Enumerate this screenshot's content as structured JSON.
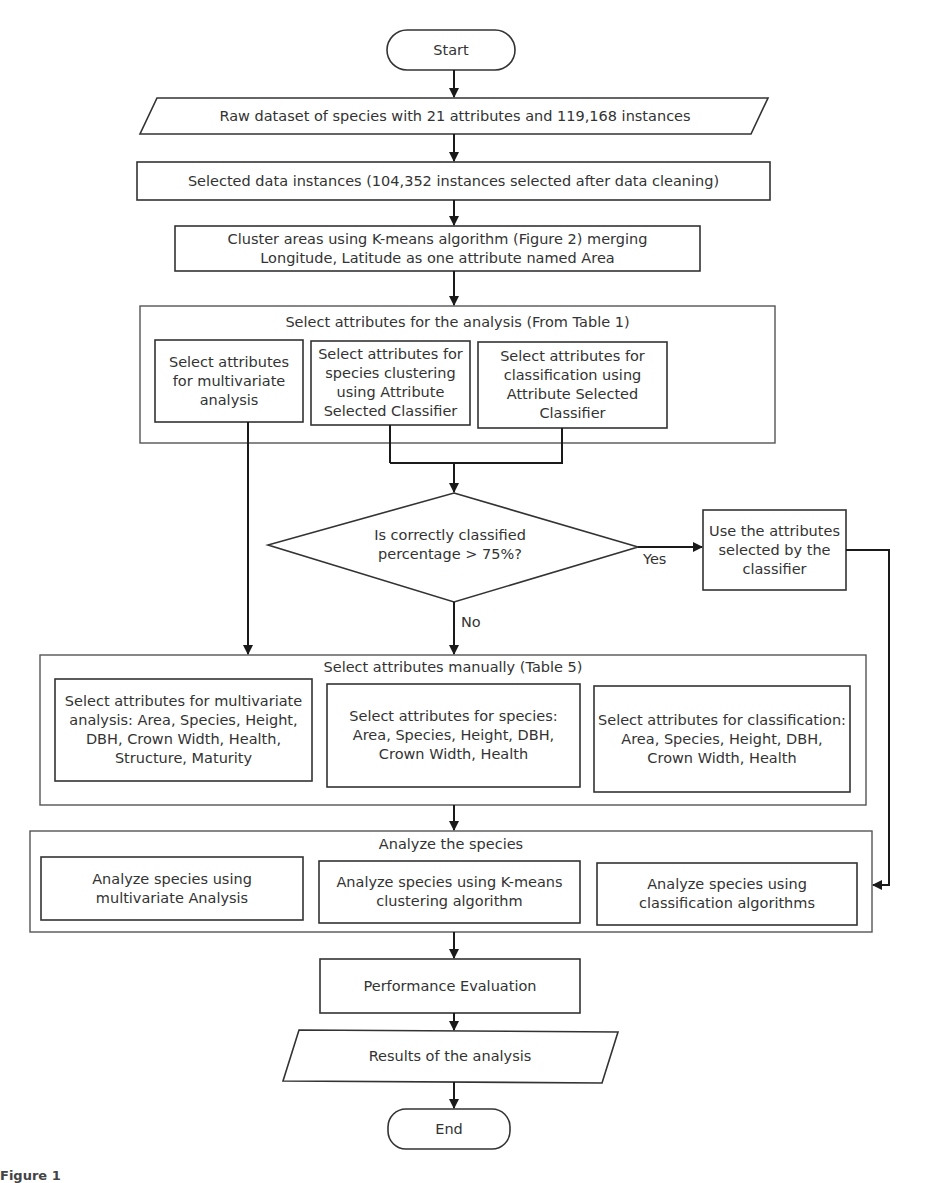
{
  "flowchart": {
    "start": "Start",
    "raw_dataset": "Raw dataset of species with 21 attributes and 119,168 instances",
    "selected_instances": "Selected data instances (104,352 instances selected after data cleaning)",
    "cluster_areas": "Cluster areas using K-means algorithm (Figure 2) merging Longitude, Latitude as one attribute named Area",
    "select_attributes_group": {
      "title": "Select attributes for the analysis (From Table 1)",
      "boxes": [
        "Select attributes for multivariate analysis",
        "Select attributes for species clustering using Attribute Selected Classifier",
        "Select attributes for classification using Attribute Selected Classifier"
      ]
    },
    "decision": {
      "question": "Is correctly classified percentage > 75%?",
      "yes_label": "Yes",
      "no_label": "No"
    },
    "use_attributes": "Use the attributes selected by the classifier",
    "manual_group": {
      "title": "Select attributes manually (Table 5)",
      "boxes": [
        "Select attributes for multivariate analysis: Area, Species, Height, DBH, Crown Width, Health, Structure, Maturity",
        "Select attributes for species: Area, Species, Height, DBH, Crown Width, Health",
        "Select attributes for classification: Area, Species, Height, DBH, Crown Width, Health"
      ]
    },
    "analyze_group": {
      "title": "Analyze the species",
      "boxes": [
        "Analyze species using multivariate Analysis",
        "Analyze species using K-means clustering algorithm",
        "Analyze species using classification algorithms"
      ]
    },
    "performance": "Performance Evaluation",
    "results": "Results of the analysis",
    "end": "End"
  },
  "caption": "Figure 1"
}
